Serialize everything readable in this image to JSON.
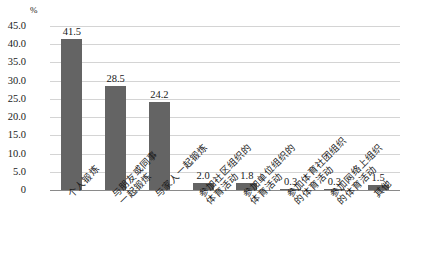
{
  "chart_data": {
    "type": "bar",
    "title": "",
    "subtitle": "",
    "xlabel": "",
    "ylabel": "%",
    "unit_label": "%",
    "ylim": [
      0,
      45
    ],
    "ytick_values": [
      45.0,
      40.0,
      35.0,
      30.0,
      25.0,
      20.0,
      15.0,
      10.0,
      5.0,
      0
    ],
    "ytick_labels": [
      "45.0",
      "40.0",
      "35.0",
      "30.0",
      "25.0",
      "20.0",
      "15.0",
      "10.0",
      "5.0",
      "0"
    ],
    "grid": true,
    "legend": "none",
    "bar_color": "#646464",
    "categories": [
      "个人锻炼",
      "与朋友或同事一起锻炼",
      "与家人一起锻炼",
      "参加社区组织的体育活动",
      "参加单位组织的体育活动",
      "参加体育社团组织的体育活动",
      "参加网络上组织的体育活动",
      "其他"
    ],
    "category_lines": [
      [
        "个人锻炼",
        ""
      ],
      [
        "与朋友或同事",
        "一起锻炼"
      ],
      [
        "与家人一起锻炼",
        ""
      ],
      [
        "参加社区组织的",
        "体育活动"
      ],
      [
        "参加单位组织的",
        "体育活动"
      ],
      [
        "参加体育社团组织",
        "的体育活动"
      ],
      [
        "参加网络上组织",
        "的体育活动"
      ],
      [
        "其他",
        ""
      ]
    ],
    "values": [
      41.5,
      28.5,
      24.2,
      2.0,
      1.8,
      0.3,
      0.3,
      1.5
    ],
    "value_labels": [
      "41.5",
      "28.5",
      "24.2",
      "2.0",
      "1.8",
      "0.3",
      "0.3",
      "1.5"
    ]
  }
}
